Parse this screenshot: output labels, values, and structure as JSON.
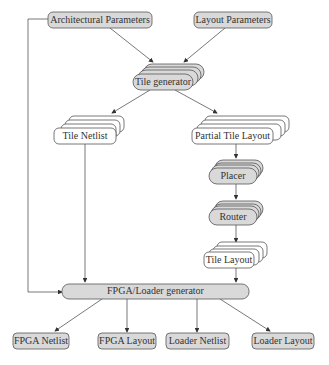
{
  "diagram": {
    "type": "flowchart",
    "inputs": {
      "arch_params": "Architectural Parameters",
      "layout_params": "Layout Parameters"
    },
    "processes": {
      "tile_generator": "Tile generator",
      "placer": "Placer",
      "router": "Router",
      "fpga_loader_generator": "FPGA/Loader generator"
    },
    "intermediates": {
      "tile_netlist": "Tile Netlist",
      "partial_tile_layout": "Partial Tile Layout",
      "tile_layout": "Tile Layout"
    },
    "outputs": {
      "fpga_netlist": "FPGA Netlist",
      "fpga_layout": "FPGA Layout",
      "loader_netlist": "Loader Netlist",
      "loader_layout": "Loader Layout"
    },
    "edges": [
      [
        "Architectural Parameters",
        "Tile generator"
      ],
      [
        "Layout Parameters",
        "Tile generator"
      ],
      [
        "Architectural Parameters",
        "FPGA/Loader generator"
      ],
      [
        "Tile generator",
        "Tile Netlist"
      ],
      [
        "Tile generator",
        "Partial Tile Layout"
      ],
      [
        "Partial Tile Layout",
        "Placer"
      ],
      [
        "Placer",
        "Router"
      ],
      [
        "Router",
        "Tile Layout"
      ],
      [
        "Tile Netlist",
        "FPGA/Loader generator"
      ],
      [
        "Tile Layout",
        "FPGA/Loader generator"
      ],
      [
        "FPGA/Loader generator",
        "FPGA Netlist"
      ],
      [
        "FPGA/Loader generator",
        "FPGA Layout"
      ],
      [
        "FPGA/Loader generator",
        "Loader Netlist"
      ],
      [
        "FPGA/Loader generator",
        "Loader Layout"
      ]
    ],
    "colors": {
      "process_fill": "#d9d9d9",
      "input_fill": "#d9d9d9",
      "doc_fill": "#ffffff",
      "stroke": "#555555"
    }
  }
}
